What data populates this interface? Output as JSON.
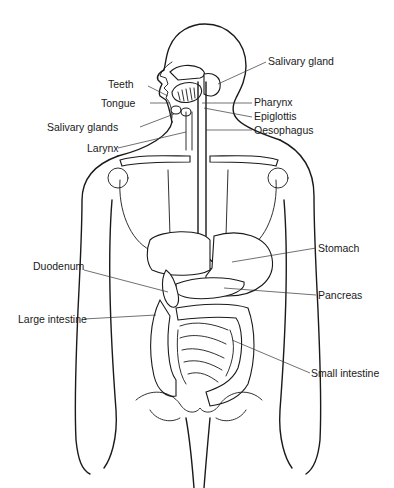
{
  "diagram": {
    "labels": {
      "salivary_gland": "Salivary gland",
      "teeth": "Teeth",
      "tongue": "Tongue",
      "pharynx": "Pharynx",
      "epiglottis": "Epiglottis",
      "salivary_glands": "Salivary glands",
      "oesophagus": "Oesophagus",
      "larynx": "Larynx",
      "stomach": "Stomach",
      "duodenum": "Duodenum",
      "pancreas": "Pancreas",
      "large_intestine": "Large intestine",
      "small_intestine": "Small intestine"
    }
  }
}
